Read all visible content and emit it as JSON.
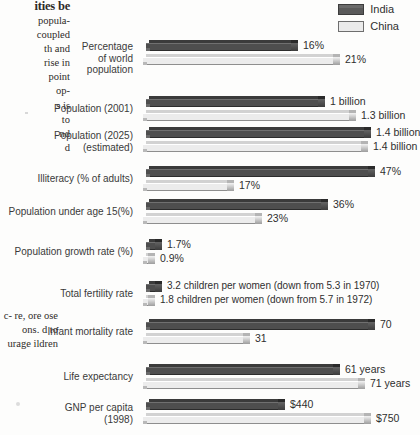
{
  "page": {
    "margin_text": {
      "heading_fragment": "ities be",
      "lines_top": [
        "popula-",
        "coupled",
        "th and",
        "rise in",
        "point",
        "op-",
        "s is",
        "to",
        "",
        "nd",
        "d"
      ],
      "lines_bottom": [
        "c-",
        "re,",
        "ore",
        "ose",
        "ons.",
        "d  to",
        "urage",
        "ildren"
      ]
    }
  },
  "legend": {
    "position": "top-right",
    "entries": [
      {
        "label": "India",
        "color": "#4e4e4e",
        "name": "india"
      },
      {
        "label": "China",
        "color": "#ececec",
        "name": "china"
      }
    ]
  },
  "chart_data": {
    "type": "bar",
    "orientation": "horizontal",
    "style": "3d-extruded",
    "title": "",
    "xlabel": "",
    "ylabel": "",
    "grid": false,
    "legend_position": "top-right",
    "series": [
      {
        "name": "India",
        "color": "#4e4e4e"
      },
      {
        "name": "China",
        "color": "#ececec"
      }
    ],
    "categories": [
      "Percentage of world population",
      "Population (2001)",
      "Population (2025) (estimated)",
      "Illiteracy (% of adults)",
      "Population under age 15(%)",
      "Population growth rate (%)",
      "Total fertility rate",
      "Infant mortality rate",
      "Life expectancy",
      "GNP per capita (1998)"
    ],
    "groups": [
      {
        "label_lines": [
          "Percentage",
          "of world",
          "population"
        ],
        "india": {
          "value": 16,
          "display": "16%",
          "bar_px": 145
        },
        "china": {
          "value": 21,
          "display": "21%",
          "bar_px": 190
        }
      },
      {
        "label_lines": [
          "Population (2001)"
        ],
        "india": {
          "value": 1.0,
          "display": "1 billion",
          "bar_px": 172
        },
        "china": {
          "value": 1.3,
          "display": "1.3 billion",
          "bar_px": 206
        }
      },
      {
        "label_lines": [
          "Population (2025)",
          "(estimated)"
        ],
        "india": {
          "value": 1.4,
          "display": "1.4 billion",
          "bar_px": 218
        },
        "china": {
          "value": 1.4,
          "display": "1.4 billion",
          "bar_px": 218
        }
      },
      {
        "label_lines": [
          "Illiteracy (% of adults)"
        ],
        "india": {
          "value": 47,
          "display": "47%",
          "bar_px": 222
        },
        "china": {
          "value": 17,
          "display": "17%",
          "bar_px": 84
        }
      },
      {
        "label_lines": [
          "Population under age 15(%)"
        ],
        "india": {
          "value": 36,
          "display": "36%",
          "bar_px": 175
        },
        "china": {
          "value": 23,
          "display": "23%",
          "bar_px": 112
        }
      },
      {
        "label_lines": [
          "Population growth rate (%)"
        ],
        "india": {
          "value": 1.7,
          "display": "1.7%",
          "bar_px": 9
        },
        "china": {
          "value": 0.9,
          "display": "0.9%",
          "bar_px": 5
        }
      },
      {
        "label_lines": [
          "Total fertility rate"
        ],
        "india": {
          "value": 3.2,
          "display": "3.2 children per women (down from 5.3 in 1970)",
          "bar_px": 9
        },
        "china": {
          "value": 1.8,
          "display": "1.8 children per women (down from 5.7 in 1972)",
          "bar_px": 5
        }
      },
      {
        "label_lines": [
          "Infant mortality rate"
        ],
        "india": {
          "value": 70,
          "display": "70",
          "bar_px": 222
        },
        "china": {
          "value": 31,
          "display": "31",
          "bar_px": 100
        }
      },
      {
        "label_lines": [
          "Life expectancy"
        ],
        "india": {
          "value": 61,
          "display": "61 years",
          "bar_px": 187
        },
        "china": {
          "value": 71,
          "display": "71 years",
          "bar_px": 215
        }
      },
      {
        "label_lines": [
          "GNP per capita",
          "(1998)"
        ],
        "india": {
          "value": 440,
          "display": "$440",
          "bar_px": 132
        },
        "china": {
          "value": 750,
          "display": "$750",
          "bar_px": 221
        }
      }
    ]
  }
}
